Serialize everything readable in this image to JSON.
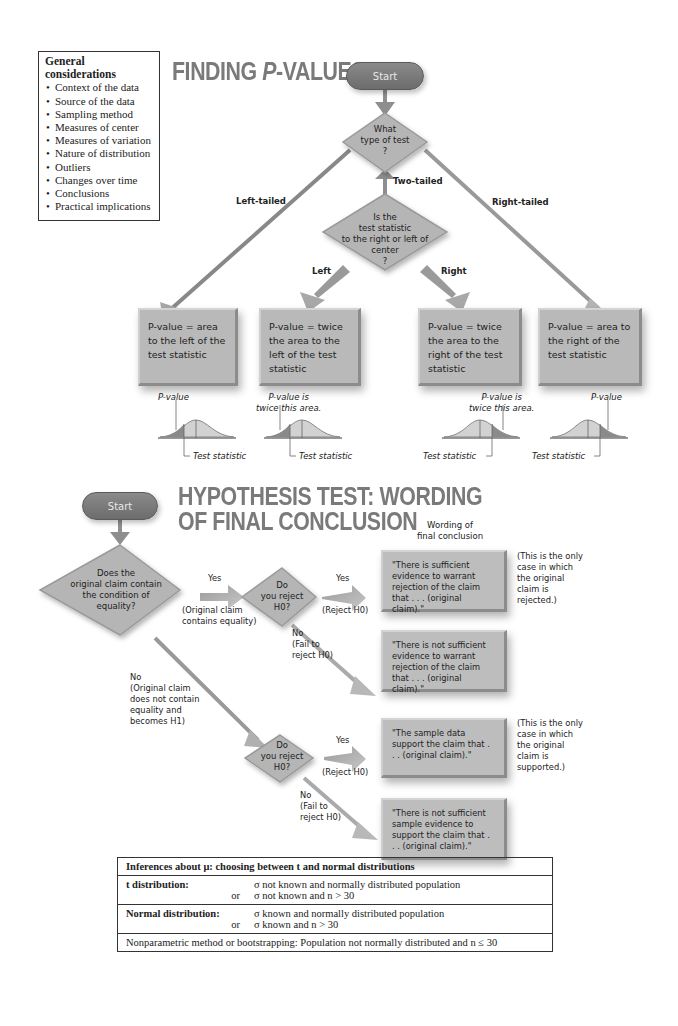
{
  "general_considerations": {
    "title": "General considerations",
    "items": [
      "Context of the data",
      "Source of the data",
      "Sampling method",
      "Measures of center",
      "Measures of variation",
      "Nature of distribution",
      "Outliers",
      "Changes over time",
      "Conclusions",
      "Practical implications"
    ]
  },
  "pvalues": {
    "title": "FINDING P-VALUES",
    "title_pre": "FINDING ",
    "title_p": "P",
    "title_post": "-VALUES",
    "start_label": "Start",
    "q1": {
      "line1": "What",
      "line2": "type of test",
      "line3": "?"
    },
    "branch_left": "Left-tailed",
    "branch_two": "Two-tailed",
    "branch_right": "Right-tailed",
    "q2": {
      "line1": "Is the",
      "line2": "test statistic",
      "line3": "to the right or left of",
      "line4": "center",
      "line5": "?"
    },
    "sub_left": "Left",
    "sub_right": "Right",
    "boxes": [
      {
        "text": "P-value = area to the left of the test statistic"
      },
      {
        "text": "P-value = twice the area to the left of the test statistic"
      },
      {
        "text": "P-value = twice the area to the right of the test statistic"
      },
      {
        "text": "P-value = area to the right of the test statistic"
      }
    ],
    "curve_labels": {
      "pvalue": "P-value",
      "twice_1": "P-value is",
      "twice_2": "twice this area.",
      "test_stat": "Test statistic"
    }
  },
  "hypothesis": {
    "title_line1": "HYPOTHESIS TEST: WORDING",
    "title_line2": "OF FINAL CONCLUSION",
    "start_label": "Start",
    "wording_header_1": "Wording of",
    "wording_header_2": "final conclusion",
    "q_equality": {
      "line1": "Does the",
      "line2": "original claim contain",
      "line3": "the condition of",
      "line4": "equality?"
    },
    "yes": "Yes",
    "orig_contains_1": "(Original claim",
    "orig_contains_2": "contains equality)",
    "q_reject": {
      "line1": "Do",
      "line2": "you reject",
      "line3": "H0?"
    },
    "reject_h0": "(Reject H0)",
    "no": "No",
    "fail_1": "(Fail to",
    "fail_2": "reject H0)",
    "no_equality": {
      "line1": "No",
      "line2": "(Original claim",
      "line3": "does not contain",
      "line4": "equality and",
      "line5": "becomes H1)"
    },
    "conclusions": [
      "\"There is sufficient evidence to warrant rejection of the claim that . . . (original claim).\"",
      "\"There is not sufficient evidence to warrant rejection of the claim that . . . (original claim).\"",
      "\"The sample data support the claim that . . . (original claim).\"",
      "\"There is not sufficient sample evidence to support the claim that . . . (original claim).\""
    ],
    "note_rejected": "(This is the only case in which the original claim is rejected.)",
    "note_supported": "(This is the only case in which the original claim is supported.)"
  },
  "inference_table": {
    "title": "Inferences about μ: choosing between t and normal distributions",
    "rows": [
      {
        "label": "t distribution:",
        "lines": [
          "σ not known and normally distributed population",
          "σ not known and n > 30"
        ],
        "or": "or"
      },
      {
        "label": "Normal distribution:",
        "lines": [
          "σ known and normally distributed population",
          "σ known and n > 30"
        ],
        "or": "or"
      }
    ],
    "footer": "Nonparametric method or bootstrapping: Population not normally distributed and n ≤ 30"
  },
  "colors": {
    "box_gray": "#b9b9b9",
    "title_gray": "#7a7a7a",
    "start_gray": "#767676",
    "shade_dark": "#8a8a8a",
    "shade_light": "#d2d2d2"
  }
}
